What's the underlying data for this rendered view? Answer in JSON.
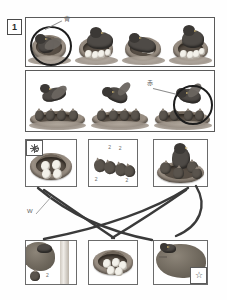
{
  "worksheet": {
    "question_number": "1",
    "title_visible": false
  },
  "row1": {
    "name": "nesting-sequence-strip",
    "highlight": {
      "cell_index": 0,
      "shape": "circle",
      "color": "#1d1d1d"
    },
    "annotation": {
      "text": "青",
      "leader": true
    },
    "cells": [
      {
        "id": "r1c1",
        "caption": "bird sitting on nest",
        "eggs": 0,
        "birds": 1,
        "circled": true
      },
      {
        "id": "r1c2",
        "caption": "bird on nest with eggs",
        "eggs": 4,
        "birds": 1,
        "circled": false
      },
      {
        "id": "r1c3",
        "caption": "bird turning eggs in nest",
        "eggs": 4,
        "birds": 1,
        "circled": false
      },
      {
        "id": "r1c4",
        "caption": "bird upright over eggs",
        "eggs": 4,
        "birds": 1,
        "circled": false
      }
    ]
  },
  "row2": {
    "name": "feeding-sequence-strip",
    "highlight": {
      "cell_index": 2,
      "shape": "circle",
      "color": "#1d1d1d"
    },
    "annotation": {
      "text": "赤",
      "leader": true
    },
    "cells": [
      {
        "id": "r2c1",
        "caption": "adult bird flying above chicks",
        "chicks": 4,
        "circled": false
      },
      {
        "id": "r2c2",
        "caption": "adult bird carrying food to chicks",
        "chicks": 4,
        "circled": false
      },
      {
        "id": "r2c3",
        "caption": "adult bird feeding chicks",
        "chicks": 4,
        "circled": true
      }
    ]
  },
  "row3": {
    "name": "upper-match-panels",
    "panels": [
      {
        "id": "p1",
        "caption": "nest with four eggs",
        "badge": "sun-icon",
        "badge_position": "top-left"
      },
      {
        "id": "p2",
        "caption": "fledglings walking in a row",
        "badge": null,
        "notes": [
          "2",
          "2",
          "2",
          "2"
        ]
      },
      {
        "id": "p3",
        "caption": "adult bird with chicks in nest",
        "badge": null
      }
    ]
  },
  "row4": {
    "name": "lower-match-panels",
    "panels": [
      {
        "id": "p4",
        "caption": "nest built in tree branches",
        "badge": null
      },
      {
        "id": "p5",
        "caption": "nest with eggs close-up",
        "badge": null
      },
      {
        "id": "p6",
        "caption": "bird at nest in tree",
        "badge": "star-icon",
        "badge_position": "bottom-right"
      }
    ]
  },
  "connectors": {
    "name": "matching-lines",
    "color": "#3a3a3a",
    "annotation": {
      "text": "W",
      "leader": true
    },
    "links": [
      {
        "from": "p1",
        "to": "p6"
      },
      {
        "from": "p3",
        "to": "p4"
      },
      {
        "from": "p3",
        "to": "p5"
      },
      {
        "from": "p1",
        "to": "p4"
      }
    ]
  },
  "colors": {
    "frame": "#5a5a5a",
    "panel_border": "#6b6b6b",
    "ink": "#2a2a2a",
    "leader": "#8d8d8d",
    "page": "#fefefe"
  }
}
